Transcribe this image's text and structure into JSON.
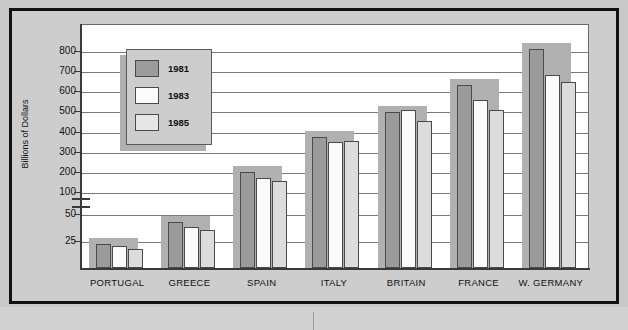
{
  "title": "",
  "chart_data": {
    "type": "bar",
    "title": "",
    "xlabel": "",
    "ylabel": "Billions of Dollars",
    "categories": [
      "PORTUGAL",
      "GREECE",
      "SPAIN",
      "ITALY",
      "BRITAIN",
      "FRANCE",
      "W. GERMANY"
    ],
    "series": [
      {
        "name": "1981",
        "color": "#9b9b9b",
        "values": [
          22,
          43,
          200,
          375,
          495,
          633,
          808
        ]
      },
      {
        "name": "1983",
        "color": "#fbfbfb",
        "values": [
          20,
          38,
          170,
          347,
          505,
          555,
          682
        ]
      },
      {
        "name": "1985",
        "color": "#dcdcdc",
        "values": [
          18,
          35,
          155,
          355,
          455,
          505,
          645
        ]
      }
    ],
    "y_ticks": [
      25,
      50,
      100,
      200,
      300,
      400,
      500,
      600,
      700,
      800
    ],
    "ylim": [
      0,
      860
    ],
    "axis_break": true,
    "axis_break_between": [
      50,
      100
    ],
    "grid": true,
    "legend_position": "upper-left",
    "legend_entries": [
      "1981",
      "1983",
      "1985"
    ]
  },
  "axis": {
    "y_title": "Billions of Dollars",
    "y_tick_labels": [
      "800",
      "700",
      "600",
      "500",
      "400",
      "300",
      "200",
      "100",
      "50",
      "25"
    ]
  },
  "legend": {
    "items": [
      {
        "label": "1981"
      },
      {
        "label": "1983"
      },
      {
        "label": "1985"
      }
    ]
  }
}
